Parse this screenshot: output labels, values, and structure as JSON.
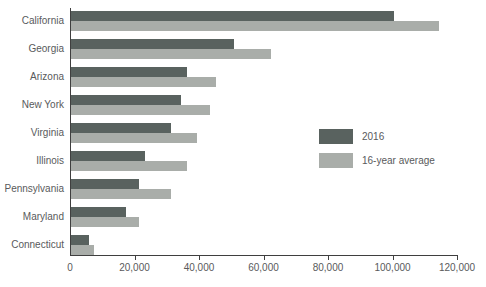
{
  "chart_data": {
    "type": "bar",
    "orientation": "horizontal",
    "title": "",
    "categories": [
      "California",
      "Georgia",
      "Arizona",
      "New York",
      "Virginia",
      "Illinois",
      "Pennsylvania",
      "Maryland",
      "Connecticut"
    ],
    "series": [
      {
        "name": "2016",
        "color": "#59625f",
        "values": [
          100000,
          50500,
          36000,
          34000,
          31000,
          23000,
          21000,
          17000,
          5500
        ]
      },
      {
        "name": "16-year average",
        "color": "#a9ada9",
        "values": [
          114000,
          62000,
          45000,
          43000,
          39000,
          36000,
          31000,
          21000,
          7000
        ]
      }
    ],
    "xlim": [
      0,
      120000
    ],
    "xticks": [
      0,
      20000,
      40000,
      60000,
      80000,
      100000,
      120000
    ],
    "xtick_labels": [
      "0",
      "20,000",
      "40,000",
      "60,000",
      "80,000",
      "100,000",
      "120,000"
    ],
    "grid": false,
    "legend_position": "center-right",
    "axis_color": "#3f3f3f",
    "text_color": "#595a5c",
    "background_color": "#ffffff"
  }
}
